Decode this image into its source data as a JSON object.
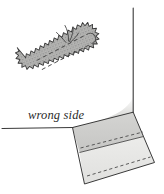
{
  "figure": {
    "type": "sewing-instruction-diagram",
    "background_color": "#ffffff"
  },
  "labels": {
    "wrong_side": "wrong side"
  },
  "colors": {
    "outline": "#3a3a3a",
    "fabric_light": "#e3e3e1",
    "fabric_mid": "#cfcfcd",
    "patch_fill": "#b9b9b7",
    "patch_stipple": "#8f8f8d",
    "stitch_dash": "#4a4a4a",
    "text": "#2b2b2b"
  },
  "elements": {
    "patch": {
      "name": "zigzag-edged patch",
      "fill": "#b9b9b7",
      "teeth_count": 46,
      "rotation_deg": -24,
      "center": [
        68,
        52
      ],
      "length": 84,
      "width": 33,
      "inner_dashed_lines": 2,
      "loose_threads": 4
    },
    "fabric_edge_line": {
      "name": "horizontal fabric edge",
      "from": [
        2,
        128
      ],
      "to": [
        72,
        127
      ]
    },
    "vertical_edge_line": {
      "name": "vertical fabric edge",
      "from": [
        133,
        8
      ],
      "to": [
        133,
        112
      ]
    },
    "corner_curve": {
      "name": "concave flare from vertical edge to hem",
      "control": [
        116,
        118
      ]
    },
    "hem_band": {
      "name": "folded hem band",
      "fill_upper": "#cfcfcd",
      "fill_lower": "#e8e8e6",
      "stitch_lines": 2,
      "corners": [
        [
          72,
          127
        ],
        [
          133,
          112
        ],
        [
          155,
          163
        ],
        [
          83,
          184
        ]
      ]
    }
  }
}
